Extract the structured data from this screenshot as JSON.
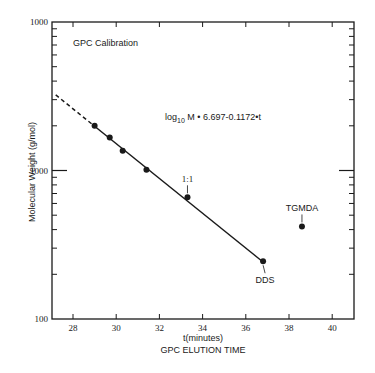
{
  "chart_data": {
    "type": "scatter",
    "title": "GPC Calibration",
    "xlabel": "t(minutes)",
    "xlabel2": "GPC ELUTION TIME",
    "ylabel": "Molecular Weight (g/mol)",
    "yscale": "log",
    "xlim": [
      27,
      41
    ],
    "ylim": [
      100,
      10000
    ],
    "x_ticks": [
      28,
      30,
      32,
      34,
      36,
      38,
      40
    ],
    "y_tick_labels": [
      {
        "value": 10000,
        "label": "1000"
      },
      {
        "value": 1000,
        "label": "1000"
      },
      {
        "value": 100,
        "label": "100"
      }
    ],
    "equation": "log10 M = 6.697-0.1172·t",
    "equation_parts": {
      "log": "log",
      "sub": "10",
      "rest": " M  •  6.697-0.1172•t"
    },
    "series": [
      {
        "name": "Calibration points",
        "points": [
          {
            "t": 29.0,
            "M": 2000
          },
          {
            "t": 29.7,
            "M": 1670
          },
          {
            "t": 30.3,
            "M": 1360
          },
          {
            "t": 31.4,
            "M": 1010
          },
          {
            "t": 33.3,
            "M": 660,
            "label": "1:1"
          },
          {
            "t": 36.8,
            "M": 245,
            "label": "DDS"
          }
        ]
      },
      {
        "name": "TGMDA",
        "points": [
          {
            "t": 38.6,
            "M": 420,
            "label": "TGMDA"
          }
        ]
      }
    ],
    "fit_line": {
      "solid": {
        "t_start": 29.0,
        "t_end": 36.8
      },
      "dashed": {
        "t_start": 27.2,
        "t_end": 29.0
      }
    },
    "grid": false,
    "legend": "none"
  }
}
